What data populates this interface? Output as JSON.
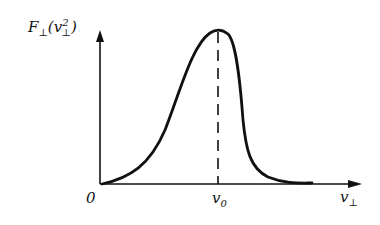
{
  "diagram": {
    "title": "",
    "y_axis_label": "F⊥(v⊥²)",
    "y_axis_label_parts": {
      "main": "F",
      "sub1": "⊥",
      "paren_open": "(",
      "var": "v",
      "sub2": "⊥",
      "sup": "2",
      "paren_close": ")"
    },
    "x_axis_label_parts": {
      "main": "v",
      "sub": "⊥"
    },
    "origin_label": "0",
    "peak_label_parts": {
      "main": "v",
      "sub": "0"
    },
    "curve": "asymmetric peaked distribution, slow rise from origin, peak at v0, steep fall then long flat tail",
    "peak_marker": "dashed vertical line from peak to x-axis at v0",
    "colors": {
      "line": "#111111",
      "background": "#ffffff"
    }
  }
}
